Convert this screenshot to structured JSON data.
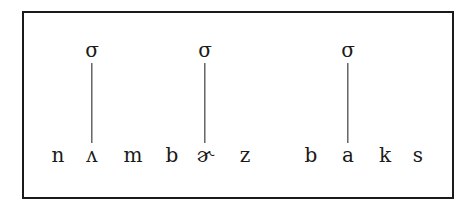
{
  "diagram": {
    "type": "syllable-structure",
    "frame": true,
    "syllable_label": "σ",
    "segments": [
      {
        "symbol": "n",
        "x": 58
      },
      {
        "symbol": "ʌ",
        "x": 92
      },
      {
        "symbol": "m",
        "x": 133
      },
      {
        "symbol": "b",
        "x": 172
      },
      {
        "symbol": "ɚ",
        "x": 205
      },
      {
        "symbol": "z",
        "x": 245
      },
      {
        "symbol": "b",
        "x": 311
      },
      {
        "symbol": "a",
        "x": 348
      },
      {
        "symbol": "k",
        "x": 385
      },
      {
        "symbol": "s",
        "x": 418
      }
    ],
    "syllables": [
      {
        "label": "σ",
        "x": 92,
        "nucleus_index": 1
      },
      {
        "label": "σ",
        "x": 205,
        "nucleus_index": 4
      },
      {
        "label": "σ",
        "x": 348,
        "nucleus_index": 7
      }
    ],
    "words": [
      "nʌmbɚz",
      "baks"
    ]
  }
}
